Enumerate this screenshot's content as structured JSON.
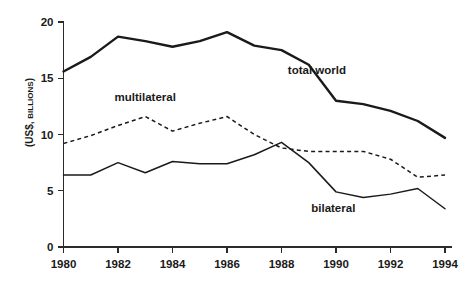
{
  "chart_data": {
    "type": "line",
    "title": "",
    "subtitle": "",
    "xlabel": "",
    "ylabel": "(US$, BILLIONS)",
    "ylabel_parts": {
      "prefix": "(US$,",
      "smallcaps": "BILLIONS",
      "suffix": ")"
    },
    "x": [
      1980,
      1981,
      1982,
      1983,
      1984,
      1985,
      1986,
      1987,
      1988,
      1989,
      1990,
      1991,
      1992,
      1993,
      1994
    ],
    "xlim": [
      1980,
      1994
    ],
    "ylim": [
      0,
      20
    ],
    "yticks": [
      0,
      5,
      10,
      15,
      20
    ],
    "ytick_labels": [
      "0",
      "5",
      "10",
      "15",
      "20"
    ],
    "xticks": [
      1980,
      1982,
      1984,
      1986,
      1988,
      1990,
      1992,
      1994
    ],
    "xtick_labels": [
      "1980",
      "1982",
      "1984",
      "1986",
      "1988",
      "1990",
      "1992",
      "1994"
    ],
    "grid": false,
    "legend_position": "inline-annotations",
    "series": [
      {
        "name": "total world",
        "style": "solid-thick",
        "label_x": 1989.3,
        "label_y": 15.4,
        "values": [
          15.6,
          16.9,
          18.7,
          18.3,
          17.8,
          18.3,
          19.1,
          17.9,
          17.5,
          16.2,
          13.0,
          12.7,
          12.1,
          11.2,
          9.7
        ]
      },
      {
        "name": "multilateral",
        "style": "dashed",
        "label_x": 1983.0,
        "label_y": 13.0,
        "values": [
          9.2,
          9.9,
          10.8,
          11.6,
          10.3,
          11.0,
          11.6,
          10.0,
          8.8,
          8.5,
          8.5,
          8.5,
          7.8,
          6.2,
          6.4
        ]
      },
      {
        "name": "bilateral",
        "style": "solid-thin",
        "label_x": 1989.9,
        "label_y": 3.1,
        "values": [
          6.4,
          6.4,
          7.5,
          6.6,
          7.6,
          7.4,
          7.4,
          8.2,
          9.3,
          7.5,
          4.9,
          4.4,
          4.7,
          5.2,
          3.4
        ]
      }
    ]
  },
  "colors": {
    "background": "#ffffff",
    "ink": "#1a1a1a",
    "axis": "#2b2b2b"
  }
}
